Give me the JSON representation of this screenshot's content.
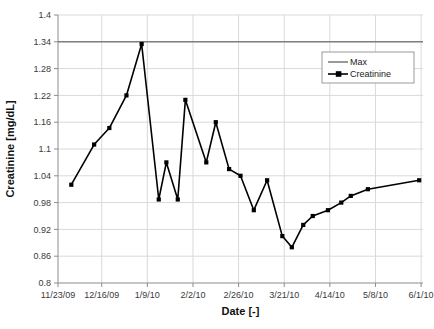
{
  "chart_data": {
    "type": "line",
    "title": "",
    "xlabel": "Date [-]",
    "ylabel": "Creatinine [mg/dL]",
    "ylim": [
      0.8,
      1.4
    ],
    "yticks": [
      0.8,
      0.86,
      0.92,
      0.98,
      1.04,
      1.1,
      1.16,
      1.22,
      1.28,
      1.34,
      1.4
    ],
    "ytick_labels": [
      "0.8",
      "0.86",
      "0.92",
      "0.98",
      "1.04",
      "1.1",
      "1.16",
      "1.22",
      "1.28",
      "1.34",
      "1.4"
    ],
    "xtick_labels": [
      "11/23/09",
      "12/16/09",
      "1/9/10",
      "2/2/10",
      "2/26/10",
      "3/21/10",
      "4/14/10",
      "5/8/10",
      "6/1/10"
    ],
    "xlim_days": [
      0,
      192
    ],
    "xtick_days": [
      0,
      23,
      47,
      71,
      95,
      119,
      143,
      167,
      191
    ],
    "grid": true,
    "legend_position": "upper-right",
    "series": [
      {
        "name": "Max",
        "color": "#808080",
        "type": "constant-line",
        "value": 1.34,
        "marker": "none"
      },
      {
        "name": "Creatinine",
        "color": "#000000",
        "marker": "square",
        "x_days": [
          7,
          19,
          27,
          36,
          44,
          53,
          57,
          63,
          67,
          78,
          83,
          90,
          96,
          103,
          110,
          118,
          123,
          129,
          134,
          142,
          149,
          154,
          163,
          190
        ],
        "x_labels": [
          "11/30/09",
          "12/12/09",
          "12/20/09",
          "12/29/09",
          "1/6/10",
          "1/15/10",
          "1/19/10",
          "1/25/10",
          "1/29/10",
          "2/9/10",
          "2/14/10",
          "2/21/10",
          "2/27/10",
          "3/6/10",
          "3/13/10",
          "3/21/10",
          "3/26/10",
          "4/1/10",
          "4/6/10",
          "4/14/10",
          "4/21/10",
          "4/26/10",
          "5/5/10",
          "6/1/10"
        ],
        "values": [
          1.02,
          1.11,
          1.147,
          1.22,
          1.335,
          0.987,
          1.07,
          0.987,
          1.21,
          1.07,
          1.16,
          1.055,
          1.04,
          0.963,
          1.03,
          0.905,
          0.88,
          0.93,
          0.95,
          0.963,
          0.98,
          0.995,
          1.01,
          1.03
        ]
      }
    ]
  },
  "legend": {
    "items": [
      {
        "label": "Max"
      },
      {
        "label": "Creatinine"
      }
    ]
  }
}
